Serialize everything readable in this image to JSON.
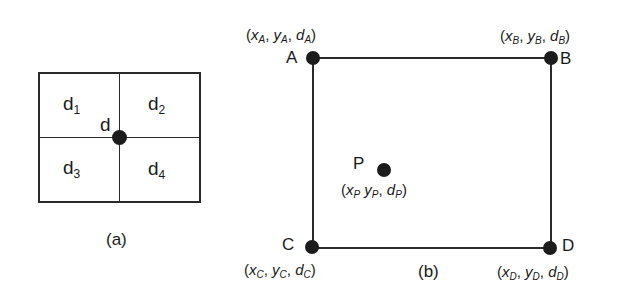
{
  "figure_a": {
    "caption": "(a)",
    "center_label": "d",
    "cells": [
      {
        "base": "d",
        "sub": "1"
      },
      {
        "base": "d",
        "sub": "2"
      },
      {
        "base": "d",
        "sub": "3"
      },
      {
        "base": "d",
        "sub": "4"
      }
    ]
  },
  "figure_b": {
    "caption": "(b)",
    "points": {
      "A": {
        "label": "A",
        "x": "x",
        "y": "y",
        "d": "d",
        "sub": "A"
      },
      "B": {
        "label": "B",
        "x": "x",
        "y": "y",
        "d": "d",
        "sub": "B"
      },
      "C": {
        "label": "C",
        "x": "x",
        "y": "y",
        "d": "d",
        "sub": "C"
      },
      "D": {
        "label": "D",
        "x": "x",
        "y": "y",
        "d": "d",
        "sub": "D"
      },
      "P": {
        "label": "P",
        "x": "x",
        "y": "y",
        "d": "d",
        "sub": "P"
      }
    }
  },
  "colors": {
    "line": "#2a2a2a",
    "dot": "#1c1c1c",
    "background": "#ffffff"
  }
}
